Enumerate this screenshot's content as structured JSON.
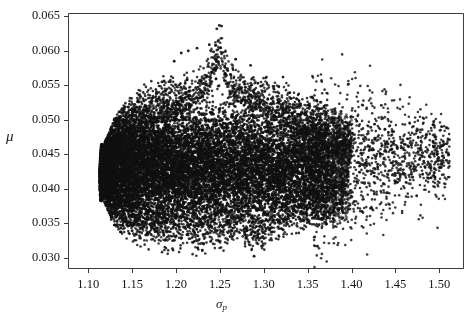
{
  "chart_data": {
    "type": "scatter",
    "title": "",
    "subtitle": "",
    "xlabel": "σ",
    "xlabel_sub": "p",
    "ylabel": "μ",
    "xlim": [
      1.077,
      1.527
    ],
    "ylim": [
      0.0285,
      0.0655
    ],
    "xticks": [
      1.1,
      1.15,
      1.2,
      1.25,
      1.3,
      1.35,
      1.4,
      1.45,
      1.5
    ],
    "xticklabels": [
      "1.10",
      "1.15",
      "1.20",
      "1.25",
      "1.30",
      "1.35",
      "1.40",
      "1.45",
      "1.50"
    ],
    "yticks": [
      0.03,
      0.035,
      0.04,
      0.045,
      0.05,
      0.055,
      0.06,
      0.065
    ],
    "yticklabels": [
      "0.030",
      "0.035",
      "0.040",
      "0.045",
      "0.050",
      "0.055",
      "0.060",
      "0.065"
    ],
    "grid": false,
    "legend": null,
    "annotations": [],
    "marker": {
      "shape": "circle",
      "size_px": 2.6,
      "color": "#111111",
      "alpha": 0.85
    },
    "n_points": 16000,
    "series": [
      {
        "name": "portfolios",
        "description": "Dense cloud of random portfolio risk-return pairs forming a Markowitz bullet; left boundary is a smooth curved efficient-frontier edge near sigma_p = 1.115, the body peaks near (1.245, 0.0637) and a sparse right tail of outliers extends to sigma_p = 1.51.",
        "cloud": {
          "sigma_min": 1.113,
          "sigma_core_max": 1.375,
          "sigma_tail_max": 1.512,
          "mu_center": 0.0432,
          "mu_min": 0.0301,
          "mu_max": 0.0637,
          "vertex_sigma": 1.2455,
          "frontier_vertex_mu": 0.0412,
          "upper_edge_points": [
            [
              1.118,
              0.0455
            ],
            [
              1.13,
              0.0492
            ],
            [
              1.145,
              0.0521
            ],
            [
              1.162,
              0.054
            ],
            [
              1.18,
              0.0552
            ],
            [
              1.2,
              0.0561
            ],
            [
              1.22,
              0.0573
            ],
            [
              1.238,
              0.0598
            ],
            [
              1.248,
              0.0637
            ],
            [
              1.262,
              0.0588
            ],
            [
              1.282,
              0.057
            ],
            [
              1.3,
              0.0563
            ],
            [
              1.32,
              0.0552
            ],
            [
              1.34,
              0.053
            ],
            [
              1.36,
              0.0521
            ],
            [
              1.385,
              0.0502
            ],
            [
              1.41,
              0.0494
            ],
            [
              1.44,
              0.0481
            ],
            [
              1.47,
              0.0463
            ],
            [
              1.505,
              0.0446
            ]
          ],
          "lower_edge_points": [
            [
              1.118,
              0.0392
            ],
            [
              1.128,
              0.0358
            ],
            [
              1.142,
              0.0338
            ],
            [
              1.16,
              0.0325
            ],
            [
              1.182,
              0.0315
            ],
            [
              1.205,
              0.0313
            ],
            [
              1.228,
              0.0311
            ],
            [
              1.25,
              0.0318
            ],
            [
              1.272,
              0.0327
            ],
            [
              1.29,
              0.0302
            ],
            [
              1.31,
              0.0332
            ],
            [
              1.335,
              0.0344
            ],
            [
              1.358,
              0.0349
            ],
            [
              1.38,
              0.0357
            ],
            [
              1.402,
              0.0368
            ],
            [
              1.425,
              0.0383
            ],
            [
              1.448,
              0.0395
            ],
            [
              1.47,
              0.0418
            ],
            [
              1.5,
              0.044
            ]
          ],
          "outliers": [
            [
              1.2495,
              0.0637
            ],
            [
              1.252,
              0.0636
            ],
            [
              1.2465,
              0.0632
            ],
            [
              1.248,
              0.0614
            ],
            [
              1.245,
              0.0608
            ],
            [
              1.238,
              0.0609
            ],
            [
              1.224,
              0.0604
            ],
            [
              1.214,
              0.06
            ],
            [
              1.206,
              0.0597
            ],
            [
              1.198,
              0.0585
            ],
            [
              1.268,
              0.0588
            ],
            [
              1.285,
              0.0579
            ],
            [
              1.303,
              0.0562
            ],
            [
              1.322,
              0.0562
            ],
            [
              1.338,
              0.053
            ],
            [
              1.352,
              0.0523
            ],
            [
              1.372,
              0.0521
            ],
            [
              1.388,
              0.0512
            ],
            [
              1.406,
              0.0498
            ],
            [
              1.422,
              0.0489
            ],
            [
              1.438,
              0.0486
            ],
            [
              1.452,
              0.0459
            ],
            [
              1.465,
              0.0461
            ],
            [
              1.478,
              0.0458
            ],
            [
              1.505,
              0.0445
            ],
            [
              1.447,
              0.0452
            ],
            [
              1.434,
              0.0521
            ],
            [
              1.426,
              0.0418
            ],
            [
              1.45,
              0.041
            ],
            [
              1.44,
              0.0394
            ],
            [
              1.412,
              0.0367
            ],
            [
              1.398,
              0.0376
            ],
            [
              1.38,
              0.0355
            ],
            [
              1.289,
              0.0302
            ],
            [
              1.23,
              0.0311
            ],
            [
              1.196,
              0.0313
            ]
          ]
        }
      }
    ]
  },
  "figure": {
    "background_color": "#ffffff",
    "plot_background_color": "#ffffff",
    "frame_color": "#3c3c3c",
    "tick_color": "#3c3c3c",
    "text_color": "#141414",
    "point_color": "#111111"
  }
}
